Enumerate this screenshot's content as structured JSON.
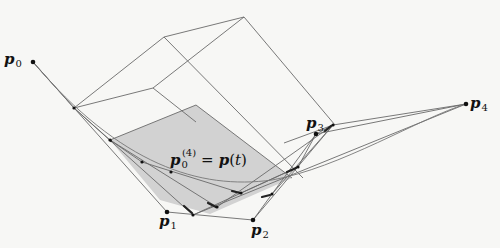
{
  "figure": {
    "colors": {
      "background": "#f7f7f5",
      "line": "#666666",
      "shade": "#d2d2d2",
      "point": "#111111"
    }
  },
  "labels": {
    "p0": {
      "base": "p",
      "sub": "0"
    },
    "p1": {
      "base": "p",
      "sub": "1"
    },
    "p2": {
      "base": "p",
      "sub": "2"
    },
    "p3": {
      "base": "p",
      "sub": "3"
    },
    "p4": {
      "base": "p",
      "sub": "4"
    },
    "curve_point": {
      "base": "p",
      "sub": "0",
      "sup": "(4)",
      "eq": "=",
      "rhs_base": "p",
      "rhs_open": "(",
      "rhs_var": "t",
      "rhs_close": ")"
    }
  },
  "points": {
    "p0": [
      33,
      62
    ],
    "p1": [
      167,
      212
    ],
    "p2": [
      253,
      220
    ],
    "p3": [
      316,
      134
    ],
    "p4": [
      466,
      104
    ]
  }
}
